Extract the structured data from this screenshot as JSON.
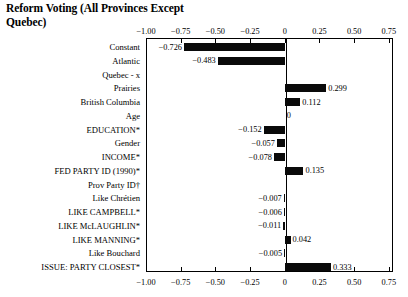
{
  "chart_data": {
    "type": "bar",
    "orientation": "horizontal",
    "title": "Reform Voting (All Provinces Except Quebec)",
    "xlabel": "",
    "ylabel": "",
    "xlim": [
      -1.0,
      0.78
    ],
    "grid": false,
    "legend": null,
    "axis_top_ticks": [
      "-1.00",
      "-0.75",
      "-0.50",
      "-0.25",
      "0",
      "0.25",
      "0.50",
      "0.75"
    ],
    "axis_bottom_ticks": [
      "-1.00",
      "-0.75",
      "-0.50",
      "-0.25",
      "0",
      "0.25",
      "0.50",
      "0.75"
    ],
    "tick_values": [
      -1.0,
      -0.75,
      -0.5,
      -0.25,
      0,
      0.25,
      0.5,
      0.75
    ],
    "categories": [
      "Constant",
      "Atlantic",
      "Quebec - x",
      "Prairies",
      "British Columbia",
      "Age",
      "EDUCATION*",
      "Gender",
      "INCOME*",
      "FED PARTY ID (1990)*",
      "Prov Party ID†",
      "Like Chrétien",
      "LIKE CAMPBELL*",
      "LIKE McLAUGHLIN*",
      "LIKE MANNING*",
      "Like Bouchard",
      "ISSUE: PARTY CLOSEST*"
    ],
    "values": [
      -0.726,
      -0.483,
      null,
      0.299,
      0.112,
      0,
      -0.152,
      -0.057,
      -0.078,
      0.135,
      null,
      -0.007,
      -0.006,
      -0.011,
      0.042,
      -0.005,
      0.333
    ],
    "value_labels": [
      "-0.726",
      "-0.483",
      "",
      "0.299",
      "0.112",
      "0",
      "-0.152",
      "-0.057",
      "-0.078",
      "0.135",
      "",
      "-0.007",
      "-0.006",
      "-0.011",
      "0.042",
      "-0.005",
      "0.333"
    ],
    "bar_color": "#0a0a0a"
  }
}
